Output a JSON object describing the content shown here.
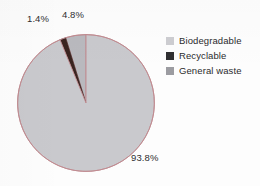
{
  "chart_data": {
    "type": "pie",
    "title": "",
    "categories": [
      "Biodegradable",
      "Recyclable",
      "General waste"
    ],
    "values": [
      93.8,
      1.4,
      4.8
    ],
    "value_labels": [
      "93.8%",
      "1.4%",
      "4.8%"
    ],
    "colors": [
      "#c9c9cd",
      "#3a2420",
      "#b9b9be"
    ],
    "units": "percent",
    "legend_position": "right",
    "grid": false,
    "start_angle_deg": 0,
    "slice_order": [
      "General waste",
      "Recyclable",
      "Biodegradable"
    ],
    "outline_color": "#c08a90"
  },
  "labels": {
    "recyclable_pct": "1.4%",
    "general_waste_pct": "4.8%",
    "biodegradable_pct": "93.8%"
  },
  "legend": {
    "items": [
      {
        "label": "Biodegradable",
        "color": "#cdcdd1"
      },
      {
        "label": "Recyclable",
        "color": "#2f2f31"
      },
      {
        "label": "General waste",
        "color": "#9c9ca1"
      }
    ]
  },
  "colors": {
    "background": "#fdfdfd",
    "pie_biodegradable": "#c9c9cd",
    "pie_recyclable": "#3a2420",
    "pie_general_waste": "#b9b9be",
    "pie_outline": "#c08a90",
    "text": "#2b2b2d"
  }
}
